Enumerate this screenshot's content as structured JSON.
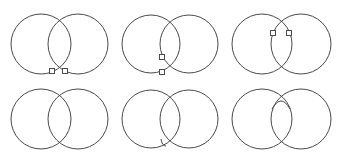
{
  "diagram": {
    "stroke_color": "#4a4a4a",
    "fill_color": "#ffffff",
    "panels": [
      {
        "id": "row1-col1",
        "circles": [
          {
            "cx": 41,
            "cy": 44,
            "r": 30
          },
          {
            "cx": 78,
            "cy": 44,
            "r": 30
          }
        ],
        "markers": [
          {
            "x": 52,
            "y": 71
          },
          {
            "x": 65,
            "y": 71
          }
        ],
        "extra_arc": null
      },
      {
        "id": "row1-col2",
        "circles": [
          {
            "cx": 151,
            "cy": 44,
            "r": 29
          },
          {
            "cx": 189,
            "cy": 44,
            "r": 29
          }
        ],
        "markers": [
          {
            "x": 162,
            "y": 57
          },
          {
            "x": 162,
            "y": 72
          }
        ],
        "extra_arc": null
      },
      {
        "id": "row1-col3",
        "circles": [
          {
            "cx": 262,
            "cy": 44,
            "r": 30
          },
          {
            "cx": 301,
            "cy": 44,
            "r": 30
          }
        ],
        "markers": [
          {
            "x": 273,
            "y": 33
          },
          {
            "x": 289,
            "y": 33
          }
        ],
        "extra_arc": null
      },
      {
        "id": "row2-col1",
        "circles": [
          {
            "cx": 41,
            "cy": 119,
            "r": 30
          },
          {
            "cx": 78,
            "cy": 119,
            "r": 30
          }
        ],
        "markers": [],
        "extra_arc": null
      },
      {
        "id": "row2-col2",
        "circles": [
          {
            "cx": 151,
            "cy": 119,
            "r": 29
          },
          {
            "cx": 189,
            "cy": 119,
            "r": 29
          }
        ],
        "markers": [],
        "extra_arc": "M161,139 Q162,146 166,146"
      },
      {
        "id": "row2-col3",
        "circles": [
          {
            "cx": 262,
            "cy": 119,
            "r": 30
          },
          {
            "cx": 301,
            "cy": 119,
            "r": 30
          }
        ],
        "markers": [],
        "extra_arc": "M272,109 Q281,93 290,109"
      }
    ]
  }
}
